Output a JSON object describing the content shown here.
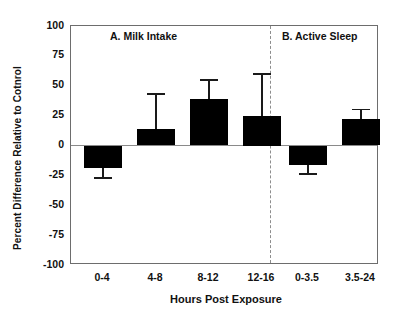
{
  "chart_data": {
    "type": "bar",
    "title": "",
    "xlabel": "Hours Post Exposure",
    "ylabel": "Percent Difference Relative to Cotnrol",
    "ylim": [
      -100,
      100
    ],
    "yticks": [
      100,
      75,
      50,
      25,
      0,
      -25,
      -50,
      -75,
      -100
    ],
    "ytick_labels": [
      "100",
      "75",
      "50",
      "25",
      "0",
      "-25",
      "-50",
      "-75",
      "-100"
    ],
    "grid": false,
    "legend": "none",
    "zero_reference_line": true,
    "panel_divider": "dashed vertical line between panel A and panel B",
    "panels": [
      {
        "id": "A",
        "title": "A. Milk Intake",
        "categories": [
          "0-4",
          "4-8",
          "8-12",
          "12-16"
        ],
        "values": [
          -19,
          14,
          39,
          25
        ],
        "error_upper": [
          -19,
          43,
          55,
          60
        ],
        "error_lower": [
          -27,
          14,
          39,
          25
        ]
      },
      {
        "id": "B",
        "title": "B. Active Sleep",
        "categories": [
          "0-3.5",
          "3.5-24"
        ],
        "values": [
          -16,
          22
        ],
        "error_upper": [
          -16,
          30
        ],
        "error_lower": [
          -24,
          22
        ]
      }
    ],
    "colors": {
      "bar": "#000000",
      "error_bar": "#1a1a1a",
      "axis": "#6d6d6d",
      "zero_line": "#8a8a8a",
      "divider": "#8d8d8d",
      "text": "#111111",
      "background": "#ffffff"
    }
  }
}
